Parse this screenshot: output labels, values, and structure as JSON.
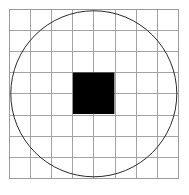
{
  "figure": {
    "canvas": {
      "width": 189,
      "height": 195,
      "background_color": "#ffffff"
    },
    "grid": {
      "name": "grid",
      "columns": 8,
      "rows": 8,
      "x_start": 9,
      "y_start": 9,
      "cell_width": 21.2,
      "cell_height": 21.2,
      "x_end": 178.6,
      "y_end": 178.6,
      "line_color": "#9a9a9a",
      "line_width": 0.9,
      "outer_border_color": "#9a9a9a",
      "outer_border_width": 1.0
    },
    "circle": {
      "name": "circle",
      "center_x": 93.8,
      "center_y": 93.8,
      "radius": 83.0,
      "stroke_color": "#2b2b2b",
      "stroke_width": 1.0,
      "fill": "none",
      "inscribed_in": "grid"
    },
    "square": {
      "name": "black-square",
      "x": 72.9,
      "y": 72.5,
      "width": 41.5,
      "height": 41.5,
      "fill_color": "#000000",
      "span_cells": "2x2",
      "centered": true
    }
  },
  "chart_data": {
    "type": "diagram",
    "xlabel": "",
    "ylabel": "",
    "xlim": [
      0,
      8
    ],
    "ylim": [
      0,
      8
    ],
    "grid": true,
    "legend": "none",
    "shapes": [
      {
        "name": "grid",
        "kind": "grid",
        "columns": 8,
        "rows": 8,
        "color": "#9a9a9a"
      },
      {
        "name": "circle",
        "kind": "circle",
        "center": [
          4,
          4
        ],
        "radius": 3.92,
        "color": "#2b2b2b",
        "fill": "none"
      },
      {
        "name": "black-square",
        "kind": "rect",
        "x": 3,
        "y": 3,
        "width": 2,
        "height": 2,
        "color": "#000000",
        "fill": "#000000"
      }
    ]
  }
}
